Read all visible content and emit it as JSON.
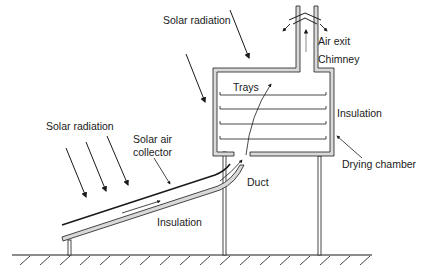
{
  "diagram": {
    "type": "solar dryer schematic",
    "labels": {
      "solar_radiation_top": "Solar radiation",
      "solar_radiation_left": "Solar radiation",
      "air_exit": "Air exit",
      "chimney": "Chimney",
      "trays": "Trays",
      "insulation_chamber": "Insulation",
      "solar_air_collector_line1": "Solar air",
      "solar_air_collector_line2": "collector",
      "drying_chamber": "Drying chamber",
      "duct": "Duct",
      "insulation_collector": "Insulation"
    },
    "components": [
      {
        "id": "collector",
        "name": "Solar air collector"
      },
      {
        "id": "duct",
        "name": "Duct"
      },
      {
        "id": "chamber",
        "name": "Drying chamber",
        "trays": 4
      },
      {
        "id": "chimney",
        "name": "Chimney"
      },
      {
        "id": "ground",
        "name": "Ground"
      }
    ],
    "colors": {
      "line": "#1a1a1a",
      "insulation_fill": "#d9d9d9",
      "background": "#ffffff"
    }
  }
}
